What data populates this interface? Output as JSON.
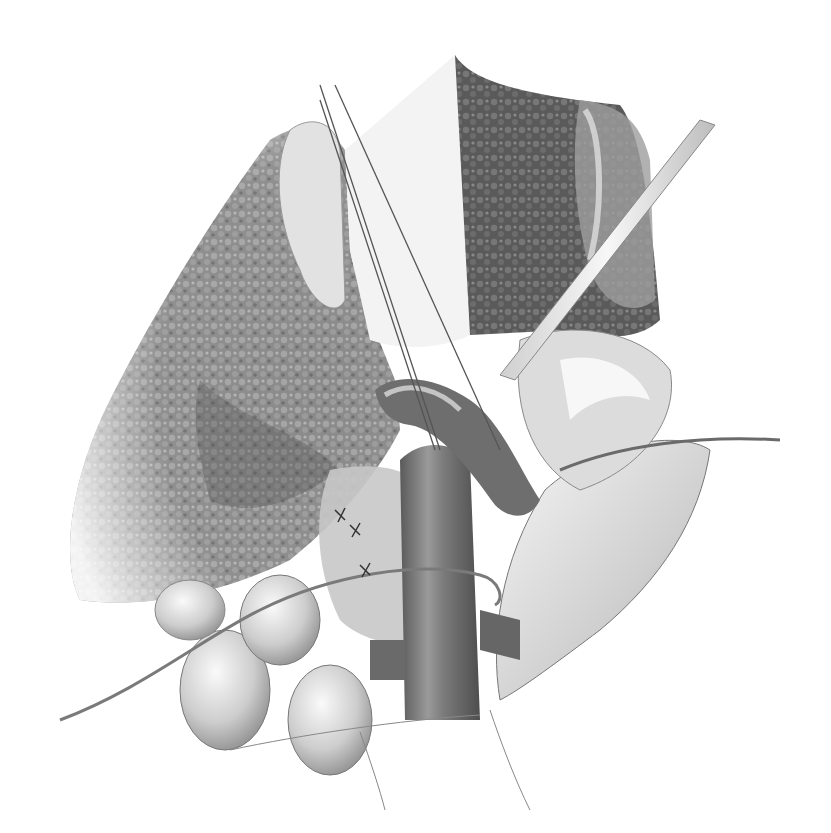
{
  "image": {
    "description": "Grayscale pencil surgical illustration of an open abdominal dissection with retractors exposing a large vessel and surrounding organs",
    "style": "graphite / pencil shading, no labels or text",
    "background_color": "#ffffff",
    "palette": {
      "dark_tissue": "#4a4a4a",
      "mid_tissue": "#8c8c8c",
      "light_tissue": "#d6d6d6",
      "highlight": "#f4f4f4",
      "outline": "#555555",
      "instrument": "#e8e8e8"
    }
  },
  "elements": {
    "liver_left": "Large stippled organ (liver) occupying the left half, mottled texture",
    "liver_right_lobe": "Dark stippled organ section at top center-right",
    "retractor_blades": "Two thin blade retractors descending from upper center",
    "right_retractor": "Long flat retractor angled from upper right toward center",
    "main_vessel": "Large tubular vessel (vena cava / aorta) running vertically through center-bottom",
    "branch_vessel": "Curved vessel branching upper-center",
    "bowel_loops": "Rounded bowel loops in lower left",
    "right_flap": "Smooth tissue flap on the lower right",
    "thin_cord": "Thin cord (ureter / vessel loop) crossing horizontally and curving to the right",
    "sutures": "Small suture marks on central tissue"
  }
}
